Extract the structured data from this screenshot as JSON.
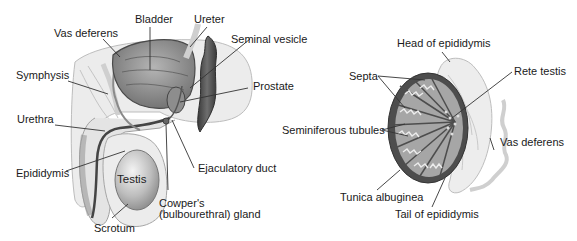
{
  "diagram": {
    "left_panel": {
      "title": "Male reproductive system (sagittal section)",
      "labels": {
        "bladder": "Bladder",
        "ureter": "Ureter",
        "vas_deferens": "Vas deferens",
        "seminal_vesicle": "Seminal vesicle",
        "symphysis": "Symphysis",
        "prostate": "Prostate",
        "urethra": "Urethra",
        "epididymis": "Epididymis",
        "testis": "Testis",
        "ejaculatory_duct": "Ejaculatory duct",
        "cowpers_line1": "Cowper's",
        "cowpers_line2": "(bulbourethral) gland",
        "scrotum": "Scrotum"
      }
    },
    "right_panel": {
      "title": "Testis (cross section)",
      "labels": {
        "head_of_epididymis": "Head of epididymis",
        "septa": "Septa",
        "rete_testis": "Rete testis",
        "seminiferous_tubules": "Seminiferous tubules",
        "vas_deferens": "Vas deferens",
        "tunica_albuginea": "Tunica albuginea",
        "tail_of_epididymis": "Tail of epididymis"
      }
    },
    "colors": {
      "outline": "#555555",
      "light_tissue": "#e6e6e6",
      "mid_tissue": "#9a9a9a",
      "dark_tissue": "#4a4a4a",
      "leader_line": "#333333"
    }
  }
}
